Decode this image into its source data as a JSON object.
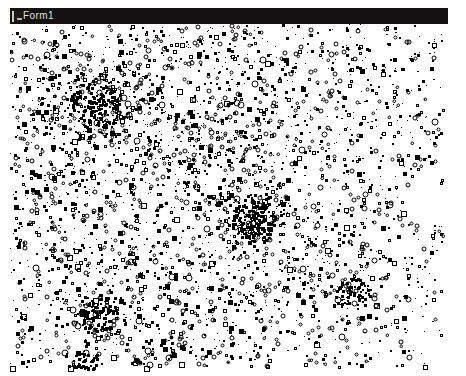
{
  "window": {
    "title": "Form1",
    "sysmenu_icon": "system-menu-icon",
    "title_bar_color": "#151110",
    "title_text_color": "#e8e3de",
    "client_background": "#ffffff",
    "mark_color": "#000000",
    "bounds": {
      "x": 10,
      "y": 8,
      "width": 438,
      "height": 364
    },
    "title_bar_height": 16,
    "client": {
      "width": 438,
      "height": 348
    }
  },
  "canvas": {
    "description": "random-scatter-plot",
    "background": "#ffffff",
    "foreground": "#000000",
    "mark_count": 3400,
    "mark_shapes": [
      "filled-square",
      "hollow-square",
      "hollow-circle",
      "dot"
    ],
    "shape_weights": [
      0.46,
      0.16,
      0.22,
      0.16
    ],
    "mark_size_min": 1,
    "mark_size_max": 5,
    "seed": 20240517,
    "density_clusters": [
      {
        "cx": 0.19,
        "cy": 0.22,
        "r": 0.16,
        "weight": 1.0
      },
      {
        "cx": 0.55,
        "cy": 0.55,
        "r": 0.13,
        "weight": 0.95
      },
      {
        "cx": 0.2,
        "cy": 0.83,
        "r": 0.11,
        "weight": 0.85
      },
      {
        "cx": 0.44,
        "cy": 0.33,
        "r": 0.18,
        "weight": 0.45
      },
      {
        "cx": 0.72,
        "cy": 0.72,
        "r": 0.15,
        "weight": 0.4
      },
      {
        "cx": 0.34,
        "cy": 0.97,
        "r": 0.09,
        "weight": 0.7
      }
    ],
    "density_falloff_right": 0.45,
    "density_falloff_bottom": 0.3
  }
}
